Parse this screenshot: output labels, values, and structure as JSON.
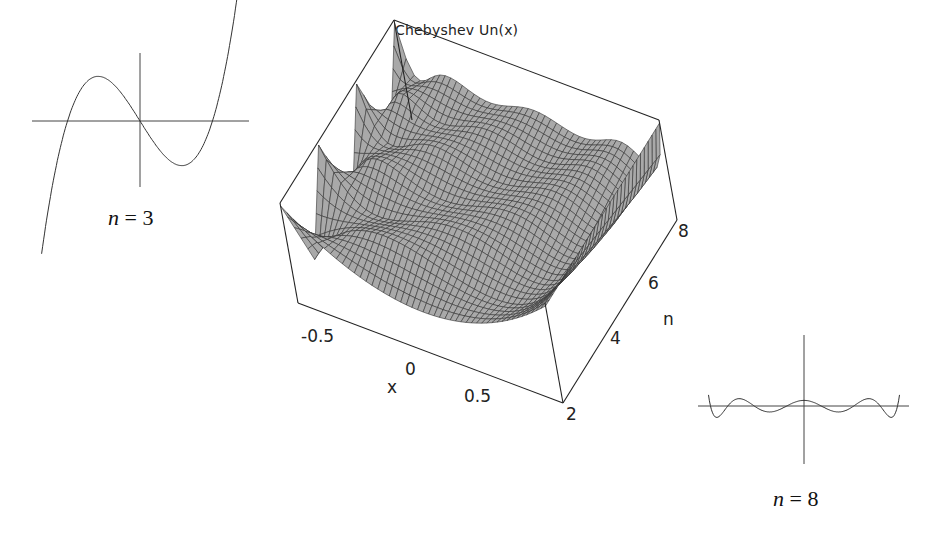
{
  "chart_data": [
    {
      "type": "surface3d",
      "title": "Chebyshev Un(x)",
      "xlabel": "x",
      "ylabel": "n",
      "zlabel": "",
      "x_ticks": [
        "-0.5",
        "0",
        "0.5"
      ],
      "n_ticks": [
        "2",
        "4",
        "6",
        "8"
      ],
      "x_range": [
        -1,
        1
      ],
      "n_range": [
        2,
        8
      ],
      "function": "U_n(x) = sin((n+1) arccos x) / sin(arccos x)",
      "box": true,
      "mesh": true,
      "surface_color": "#a8a8a8"
    },
    {
      "type": "line",
      "title": "",
      "label_var": "n",
      "label_value": "3",
      "function": "U_3(x) = 8x^3 - 4x",
      "x_range": [
        -1,
        1
      ],
      "axes": true,
      "position": "top-left"
    },
    {
      "type": "line",
      "title": "",
      "label_var": "n",
      "label_value": "8",
      "function": "U_8(x)",
      "x_range": [
        -1,
        1
      ],
      "axes": true,
      "position": "bottom-right"
    }
  ],
  "labels": {
    "title": "Chebyshev Un(x)",
    "x_axis": "x",
    "n_axis": "n",
    "x_tick_neg": "-0.5",
    "x_tick_zero": "0",
    "x_tick_pos": "0.5",
    "n_tick_2": "2",
    "n_tick_4": "4",
    "n_tick_6": "6",
    "n_tick_8": "8",
    "small1_var": "n",
    "small1_eq": " = 3",
    "small2_var": "n",
    "small2_eq": " = 8"
  }
}
